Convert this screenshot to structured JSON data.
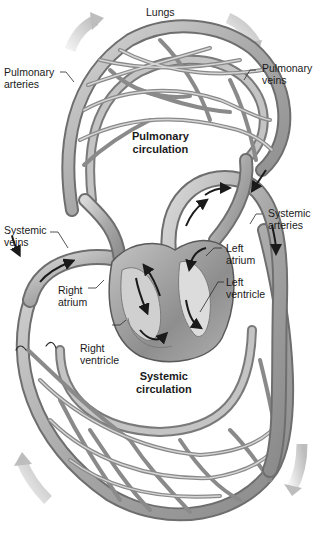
{
  "diagram": {
    "labels": {
      "lungs": "Lungs",
      "pulmonary_arteries": [
        "Pulmonary",
        "arteries"
      ],
      "pulmonary_veins": [
        "Pulmonary",
        "veins"
      ],
      "pulmonary_circulation": [
        "Pulmonary",
        "circulation"
      ],
      "systemic_veins": [
        "Systemic",
        "veins"
      ],
      "systemic_arteries": [
        "Systemic",
        "arteries"
      ],
      "left_atrium": [
        "Left",
        "atrium"
      ],
      "left_ventricle": [
        "Left",
        "ventricle"
      ],
      "right_atrium": [
        "Right",
        "atrium"
      ],
      "right_ventricle": [
        "Right",
        "ventricle"
      ],
      "systemic_circulation": [
        "Systemic",
        "circulation"
      ]
    },
    "colors": {
      "vessel_fill": "#b8b8b8",
      "vessel_edge": "#6e6e6e",
      "vessel_highlight": "#e6e6e6",
      "heart_fill": "#9a9a9a",
      "flow_arrow": "#1a1a1a",
      "direction_arrow": "#d0d0d0",
      "text": "#1a1a1a"
    }
  }
}
